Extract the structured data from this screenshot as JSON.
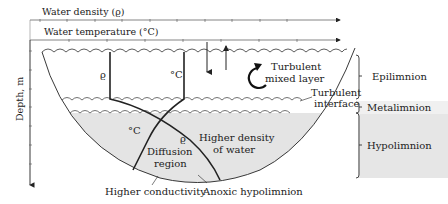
{
  "axes": {
    "density_label": "Water density (ϱ)",
    "temperature_label": "Water temperature (°C)",
    "depth_label": "Depth, m"
  },
  "profiles": {
    "density_symbol": "ϱ",
    "temperature_symbol": "°C",
    "lower_temperature_symbol": "°C",
    "lower_density_symbol": "ϱ"
  },
  "annotations": {
    "turbulent_mixed_line1": "Turbulent",
    "turbulent_mixed_line2": "mixed layer",
    "turbulent_interface_line1": "Turbulent",
    "turbulent_interface_line2": "interface",
    "diffusion_line1": "Diffusion",
    "diffusion_line2": "region",
    "higher_density_line1": "Higher density",
    "higher_density_line2": "of water",
    "higher_conductivity": "Higher conductivity",
    "anoxic_hypolimnion": "Anoxic hypolimnion"
  },
  "layers": [
    {
      "name": "Epilimnion",
      "color": "#ffffff"
    },
    {
      "name": "Metalimnion",
      "color": "#f0f0f0"
    },
    {
      "name": "Hypolimnion",
      "color": "#e6e6e6"
    }
  ],
  "colors": {
    "hypolimnion_fill": "#e4e4e4",
    "metalimnion_fill": "#f0f0f0",
    "line": "#222222",
    "axis_box": "#888888"
  }
}
